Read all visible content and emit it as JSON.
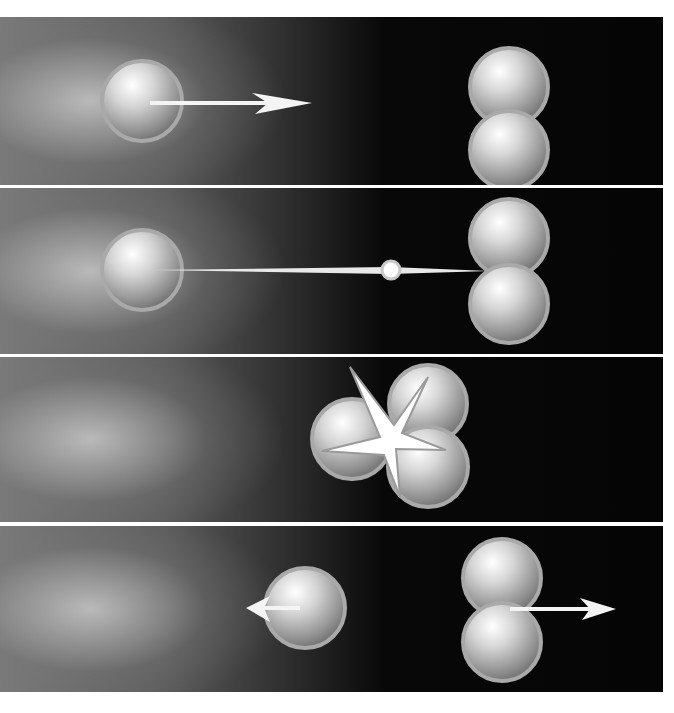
{
  "figure": {
    "panels": [
      {
        "index": 1,
        "label": "approach",
        "elements": [
          "single sphere",
          "rightward arrow",
          "sphere pair"
        ]
      },
      {
        "index": 2,
        "label": "impact path",
        "elements": [
          "single sphere",
          "trajectory streak",
          "impact point",
          "sphere pair"
        ]
      },
      {
        "index": 3,
        "label": "collision",
        "elements": [
          "three merged spheres",
          "starburst flash"
        ]
      },
      {
        "index": 4,
        "label": "separation",
        "elements": [
          "single sphere",
          "leftward arrow",
          "sphere pair",
          "rightward arrow"
        ]
      }
    ],
    "colors": {
      "background_dark": "#050505",
      "background_light": "#9a9a9a",
      "sphere": "#d8d8d8",
      "sphere_rim": "#a8a8a8",
      "arrow": "#ffffff"
    }
  }
}
